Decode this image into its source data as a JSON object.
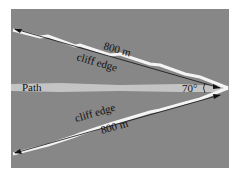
{
  "diagram": {
    "background_color": "#878787",
    "path_color": "#c4c4c4",
    "edge_color": "#f4f4f4",
    "labels": {
      "path": "Path",
      "upper_edge": "cliff edge",
      "lower_edge": "cliff edge",
      "upper_length": "800 m",
      "lower_length": "800 m",
      "angle": "70°"
    }
  }
}
